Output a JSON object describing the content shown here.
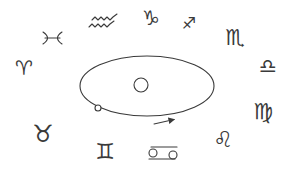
{
  "diagram": {
    "colors": {
      "background": "#ffffff",
      "ink": "#3a3a3a"
    },
    "orbit": {
      "cx": 147,
      "cy": 86,
      "rx": 67,
      "ry": 30,
      "sun": {
        "cx": 141,
        "cy": 85,
        "r": 7
      },
      "planet": {
        "cx": 98,
        "cy": 108,
        "r": 3
      },
      "direction_arrow": {
        "x1": 154,
        "y1": 124,
        "x2": 176,
        "y2": 119
      }
    },
    "signs": [
      {
        "name": "Aries",
        "glyph": "♈",
        "icon": "aries-icon",
        "x": 24,
        "y": 68,
        "size": 20
      },
      {
        "name": "Taurus",
        "glyph": "♉",
        "icon": "taurus-icon",
        "x": 43,
        "y": 134,
        "size": 24
      },
      {
        "name": "Gemini",
        "glyph": "♊",
        "icon": "gemini-icon",
        "x": 105,
        "y": 152,
        "size": 22
      },
      {
        "name": "Cancer",
        "glyph": "♋",
        "icon": "cancer-icon",
        "x": 163,
        "y": 153,
        "size": 18
      },
      {
        "name": "Leo",
        "glyph": "♌",
        "icon": "leo-icon",
        "x": 223,
        "y": 140,
        "size": 22
      },
      {
        "name": "Virgo",
        "glyph": "♍",
        "icon": "virgo-icon",
        "x": 263,
        "y": 112,
        "size": 22
      },
      {
        "name": "Libra",
        "glyph": "♎",
        "icon": "libra-icon",
        "x": 268,
        "y": 66,
        "size": 20
      },
      {
        "name": "Scorpio",
        "glyph": "♏",
        "icon": "scorpio-icon",
        "x": 235,
        "y": 38,
        "size": 22
      },
      {
        "name": "Sagittarius",
        "glyph": "♐",
        "icon": "sagittarius-icon",
        "x": 189,
        "y": 24,
        "size": 16
      },
      {
        "name": "Capricorn",
        "glyph": "♑",
        "icon": "capricorn-icon",
        "x": 151,
        "y": 18,
        "size": 20
      },
      {
        "name": "Aquarius",
        "glyph": "♒",
        "icon": "aquarius-icon",
        "x": 104,
        "y": 21,
        "size": 20
      },
      {
        "name": "Pisces",
        "glyph": "♓",
        "icon": "pisces-icon",
        "x": 52,
        "y": 38,
        "size": 18
      }
    ]
  }
}
